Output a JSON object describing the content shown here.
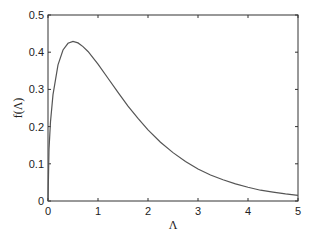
{
  "chart_data": {
    "type": "line",
    "title": "",
    "xlabel": "Λ",
    "ylabel": "f(Λ)",
    "xlim": [
      0,
      5
    ],
    "ylim": [
      0,
      0.5
    ],
    "xticks": [
      0,
      1,
      2,
      3,
      4,
      5
    ],
    "xtick_labels": [
      "0",
      "1",
      "2",
      "3",
      "4",
      "5"
    ],
    "yticks": [
      0,
      0.1,
      0.2,
      0.3,
      0.4,
      0.5
    ],
    "ytick_labels": [
      "0",
      "0.1",
      "0.2",
      "0.3",
      "0.4",
      "0.5"
    ],
    "grid": false,
    "legend": null,
    "series": [
      {
        "name": "f(Λ)",
        "color": "#555555",
        "x": [
          0,
          0.02,
          0.05,
          0.1,
          0.2,
          0.3,
          0.4,
          0.5,
          0.6,
          0.7,
          0.8,
          1.0,
          1.2,
          1.4,
          1.6,
          1.8,
          2.0,
          2.25,
          2.5,
          2.75,
          3.0,
          3.25,
          3.5,
          3.75,
          4.0,
          4.25,
          4.5,
          4.75,
          5.0
        ],
        "y": [
          0,
          0.139,
          0.213,
          0.286,
          0.366,
          0.406,
          0.424,
          0.429,
          0.425,
          0.415,
          0.402,
          0.368,
          0.33,
          0.292,
          0.255,
          0.222,
          0.191,
          0.158,
          0.13,
          0.106,
          0.086,
          0.07,
          0.057,
          0.046,
          0.037,
          0.029,
          0.024,
          0.019,
          0.015
        ]
      }
    ]
  }
}
